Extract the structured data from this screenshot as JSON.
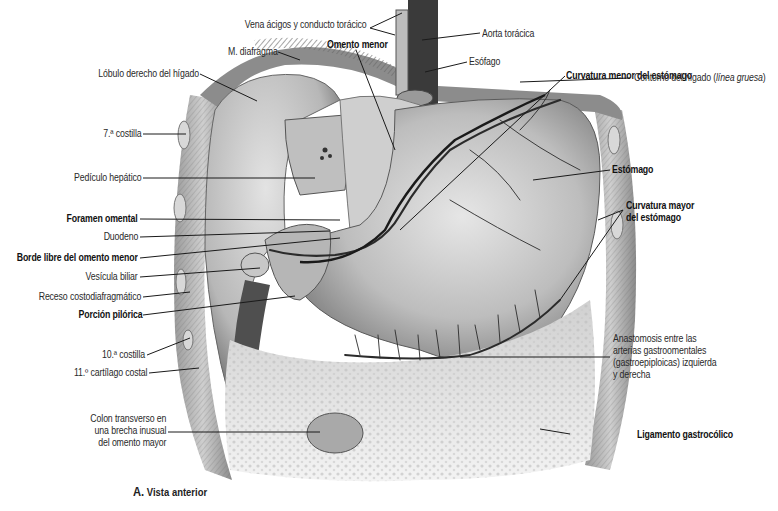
{
  "figure": {
    "caption_letter": "A.",
    "caption_text": "Vista anterior"
  },
  "labels": {
    "vena_acigos": "Vena ácigos y conducto torácico",
    "aorta": "Aorta torácica",
    "m_diafragma": "M. diafragma",
    "omento_menor": "Omento menor",
    "esofago": "Esófago",
    "lobulo_derecho": "Lóbulo derecho del hígado",
    "curvatura_menor": "Curvatura menor del estómago",
    "contorno_higado": "Contorno del hígado (",
    "contorno_higado_italic": "línea gruesa",
    "contorno_higado_end": ")",
    "costilla_7": "7.ª costilla",
    "pediculo": "Pedículo hepático",
    "estomago": "Estómago",
    "curvatura_mayor": "Curvatura mayor\ndel estómago",
    "foramen": "Foramen omental",
    "duodeno": "Duodeno",
    "borde_libre": "Borde libre del omento menor",
    "vesicula": "Vesícula biliar",
    "receso": "Receso costodiafragmático",
    "porcion_pilorica": "Porción pilórica",
    "costilla_10": "10.ª costilla",
    "cartilago_11": "11.º cartílago costal",
    "anastomosis": "Anastomosis entre las\narterias gastroomentales\n(gastroepiploicas) izquierda\ny derecha",
    "colon": "Colon transverso en\nuna brecha inusual\ndel omento mayor",
    "ligamento": "Ligamento gastrocólico"
  },
  "colors": {
    "background": "#ffffff",
    "text": "#2a2a2a",
    "leader_line": "#1a1a1a",
    "organ_light": "#d9d9d9",
    "organ_mid": "#a8a8a8",
    "organ_dark": "#555555",
    "vessel": "#2b2b2b",
    "aorta": "#3a3a3a"
  }
}
